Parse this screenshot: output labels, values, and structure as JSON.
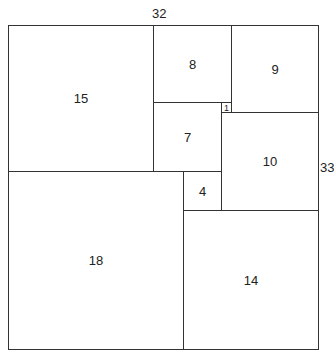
{
  "dimension_labels": {
    "width": "32",
    "height": "33"
  },
  "squares": [
    {
      "size": "15",
      "x": 8,
      "y": 25,
      "w": 146,
      "h": 147
    },
    {
      "size": "8",
      "x": 153,
      "y": 25,
      "w": 79,
      "h": 78
    },
    {
      "size": "9",
      "x": 231,
      "y": 25,
      "w": 88,
      "h": 88
    },
    {
      "size": "1",
      "x": 221,
      "y": 102,
      "w": 11,
      "h": 11
    },
    {
      "size": "7",
      "x": 153,
      "y": 102,
      "w": 69,
      "h": 70
    },
    {
      "size": "10",
      "x": 221,
      "y": 112,
      "w": 98,
      "h": 99
    },
    {
      "size": "4",
      "x": 183,
      "y": 171,
      "w": 39,
      "h": 40
    },
    {
      "size": "18",
      "x": 8,
      "y": 171,
      "w": 176,
      "h": 179
    },
    {
      "size": "14",
      "x": 183,
      "y": 210,
      "w": 136,
      "h": 140
    }
  ]
}
